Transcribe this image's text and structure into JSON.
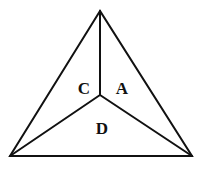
{
  "diagram": {
    "type": "triangle-partition",
    "vertices": {
      "apex": [
        100,
        11
      ],
      "bottom_left": [
        10,
        156
      ],
      "bottom_right": [
        192,
        156
      ],
      "center": [
        100,
        95
      ]
    },
    "regions": [
      {
        "id": "C",
        "label": "C",
        "pos": [
          84,
          94
        ]
      },
      {
        "id": "A",
        "label": "A",
        "pos": [
          122,
          94
        ]
      },
      {
        "id": "D",
        "label": "D",
        "pos": [
          102,
          134
        ]
      }
    ],
    "stroke_color": "#111111"
  }
}
